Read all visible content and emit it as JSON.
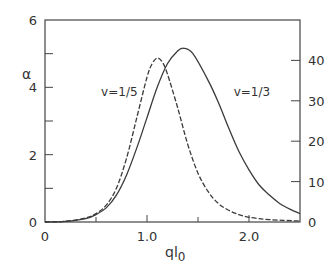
{
  "chart_data": {
    "type": "line",
    "title": "",
    "xlabel": "ql0",
    "xlabel_main": "ql",
    "xlabel_sub": "0",
    "ylabel": "α",
    "ylabel_right": "",
    "xlim": [
      0,
      2.5
    ],
    "ylim": [
      0,
      6
    ],
    "ylim_right": [
      0,
      50
    ],
    "grid": false,
    "legend": "none",
    "x_ticks": [
      {
        "value": 0,
        "label": "0"
      },
      {
        "value": 1.0,
        "label": "1.0"
      },
      {
        "value": 2.0,
        "label": "2.0"
      }
    ],
    "x_minor_ticks": [
      0.5,
      1.5
    ],
    "y_ticks_left": [
      {
        "value": 0,
        "label": "0"
      },
      {
        "value": 2,
        "label": "2"
      },
      {
        "value": 4,
        "label": "4"
      },
      {
        "value": 6,
        "label": "6"
      }
    ],
    "y_minor_ticks_left": [
      1,
      3,
      5
    ],
    "y_ticks_right": [
      {
        "value": 0,
        "label": "0"
      },
      {
        "value": 10,
        "label": "10"
      },
      {
        "value": 20,
        "label": "20"
      },
      {
        "value": 30,
        "label": "30"
      },
      {
        "value": 40,
        "label": "40"
      }
    ],
    "series": [
      {
        "name": "v=1/5",
        "style": "dashed",
        "x": [
          0.0,
          0.2,
          0.4,
          0.5,
          0.6,
          0.7,
          0.8,
          0.9,
          1.0,
          1.05,
          1.1,
          1.15,
          1.2,
          1.3,
          1.4,
          1.5,
          1.6,
          1.7,
          1.8,
          1.9,
          2.0,
          2.2,
          2.5
        ],
        "values": [
          0.0,
          0.02,
          0.12,
          0.25,
          0.5,
          1.0,
          1.9,
          3.1,
          4.3,
          4.7,
          4.87,
          4.75,
          4.4,
          3.4,
          2.3,
          1.45,
          0.9,
          0.55,
          0.35,
          0.22,
          0.14,
          0.07,
          0.03
        ]
      },
      {
        "name": "v=1/3",
        "style": "solid",
        "x": [
          0.0,
          0.2,
          0.4,
          0.5,
          0.6,
          0.7,
          0.8,
          0.9,
          1.0,
          1.1,
          1.2,
          1.3,
          1.36,
          1.45,
          1.6,
          1.7,
          1.8,
          1.9,
          2.0,
          2.1,
          2.2,
          2.3,
          2.4,
          2.5
        ],
        "values": [
          0.0,
          0.02,
          0.1,
          0.22,
          0.42,
          0.8,
          1.4,
          2.2,
          3.1,
          4.0,
          4.7,
          5.08,
          5.16,
          5.0,
          4.2,
          3.55,
          2.8,
          2.1,
          1.55,
          1.1,
          0.8,
          0.55,
          0.38,
          0.25
        ]
      }
    ],
    "annotations": [
      {
        "text": "v=1/5",
        "x": 0.55,
        "y": 3.75
      },
      {
        "text": "v=1/3",
        "x": 1.85,
        "y": 3.75
      }
    ]
  }
}
